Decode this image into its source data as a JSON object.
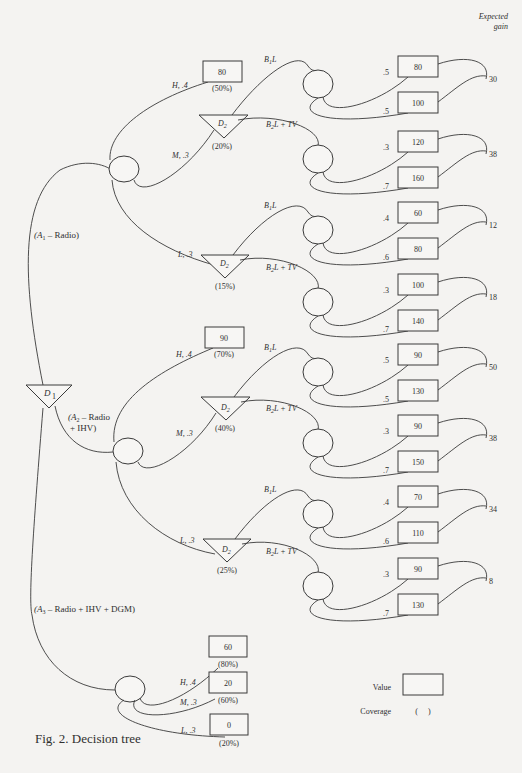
{
  "figure": {
    "caption": "Fig. 2. Decision tree",
    "header": {
      "line1": "Expected",
      "line2": "gain"
    }
  },
  "root": {
    "label": "D",
    "sub": "1"
  },
  "alternatives": [
    {
      "label": "(A",
      "sub": "1",
      "rest": " – Radio)"
    },
    {
      "label": "(A",
      "sub": "2",
      "rest": " – Radio",
      "rest2": "+ IHV)"
    },
    {
      "label": "(A",
      "sub": "3",
      "rest": " – Radio + IHV + DGM)"
    }
  ],
  "groups": [
    {
      "outcomes": [
        {
          "branch": "H, .4",
          "value": "80",
          "coverage": "(50%)"
        },
        {
          "branch": "M, .3",
          "decision": "D",
          "decision_sub": "2",
          "coverage": "(20%)"
        },
        {
          "branch": "L, .3",
          "decision": "D",
          "decision_sub": "2",
          "coverage": "(15%)"
        }
      ],
      "subtrees": [
        {
          "from": "M",
          "option": "B1L",
          "opt_main": "B",
          "opt_sub": "1",
          "opt_rest": "L",
          "probs": [
            ".5",
            ".5"
          ],
          "values": [
            "80",
            "100"
          ],
          "expected_gain": "30"
        },
        {
          "from": "M",
          "option": "B2L + TV",
          "opt_main": "B",
          "opt_sub": "2",
          "opt_rest": "L + TV",
          "probs": [
            ".3",
            ".7"
          ],
          "values": [
            "120",
            "160"
          ],
          "expected_gain": "38"
        },
        {
          "from": "L",
          "option": "B1L",
          "opt_main": "B",
          "opt_sub": "1",
          "opt_rest": "L",
          "probs": [
            ".4",
            ".6"
          ],
          "values": [
            "60",
            "80"
          ],
          "expected_gain": "12"
        },
        {
          "from": "L",
          "option": "B2L + TV",
          "opt_main": "B",
          "opt_sub": "2",
          "opt_rest": "L + TV",
          "probs": [
            ".3",
            ".7"
          ],
          "values": [
            "100",
            "140"
          ],
          "expected_gain": "18"
        }
      ]
    },
    {
      "outcomes": [
        {
          "branch": "H, .4",
          "value": "90",
          "coverage": "(70%)"
        },
        {
          "branch": "M, .3",
          "decision": "D",
          "decision_sub": "2",
          "coverage": "(40%)"
        },
        {
          "branch": "L, .3",
          "decision": "D",
          "decision_sub": "2",
          "coverage": "(25%)"
        }
      ],
      "subtrees": [
        {
          "from": "M",
          "option": "B1L",
          "opt_main": "B",
          "opt_sub": "1",
          "opt_rest": "L",
          "probs": [
            ".5",
            ".5"
          ],
          "values": [
            "90",
            "130"
          ],
          "expected_gain": "50"
        },
        {
          "from": "M",
          "option": "B2L + TV",
          "opt_main": "B",
          "opt_sub": "2",
          "opt_rest": "L + TV",
          "probs": [
            ".3",
            ".7"
          ],
          "values": [
            "90",
            "150"
          ],
          "expected_gain": "38"
        },
        {
          "from": "L",
          "option": "B1L",
          "opt_main": "B",
          "opt_sub": "1",
          "opt_rest": "L",
          "probs": [
            ".4",
            ".6"
          ],
          "values": [
            "70",
            "110"
          ],
          "expected_gain": "34"
        },
        {
          "from": "L",
          "option": "B2L + TV",
          "opt_main": "B",
          "opt_sub": "2",
          "opt_rest": "L + TV",
          "probs": [
            ".3",
            ".7"
          ],
          "values": [
            "90",
            "130"
          ],
          "expected_gain": "8"
        }
      ]
    },
    {
      "outcomes": [
        {
          "branch": "H, .4",
          "value": "60",
          "coverage": "(80%)"
        },
        {
          "branch": "M, .3",
          "value": "20",
          "coverage": "(60%)"
        },
        {
          "branch": "L, .3",
          "value": "0",
          "coverage": "(20%)"
        }
      ]
    }
  ],
  "legend": {
    "value_label": "Value",
    "coverage_label": "Coverage",
    "coverage_symbol": "(     )"
  }
}
